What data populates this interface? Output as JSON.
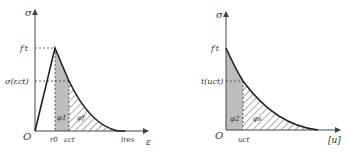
{
  "left_chart": {
    "y_axis_label": "σ",
    "x_axis_label": "ε",
    "origin_label": "O",
    "peak_label": "f′t",
    "mid_stress_label": "σ(εct)",
    "x_ticks": [
      "r0",
      "εct",
      "lres"
    ],
    "region_labels": [
      "φ1",
      "φf"
    ]
  },
  "right_chart": {
    "y_axis_label": "σ",
    "x_axis_label": "[u]",
    "origin_label": "O",
    "peak_label": "f′t",
    "mid_stress_label": "t(uct)",
    "x_ticks": [
      "uct"
    ],
    "region_labels": [
      "φ2",
      "φs"
    ]
  },
  "colors": {
    "line": "#222222",
    "shade": "#bdbdbd",
    "hatch": "#555555"
  }
}
